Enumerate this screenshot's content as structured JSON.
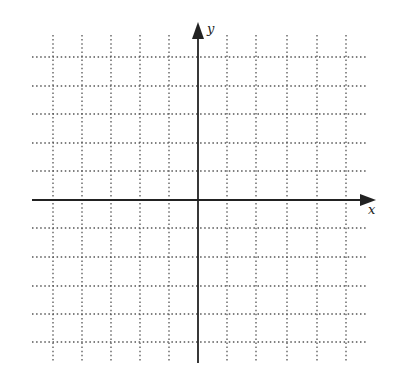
{
  "diagram": {
    "type": "coordinate-grid",
    "x_axis": {
      "label": "x",
      "y_px": 200,
      "start_px": 32,
      "end_px": 376
    },
    "y_axis": {
      "label": "y",
      "x_px": 198,
      "start_px": 363,
      "end_px": 22
    },
    "grid": {
      "vertical_lines_px": [
        53,
        82,
        111,
        140,
        169,
        227,
        256,
        287,
        317,
        346
      ],
      "horizontal_lines_px": [
        57,
        86,
        114,
        143,
        171,
        228,
        257,
        286,
        314,
        342
      ],
      "v_top_px": 35,
      "v_bottom_px": 363,
      "h_left_px": 32,
      "h_right_px": 368,
      "style": "dotted"
    },
    "colors": {
      "grid": "#555555",
      "axis": "#222222",
      "background": "#ffffff"
    }
  }
}
